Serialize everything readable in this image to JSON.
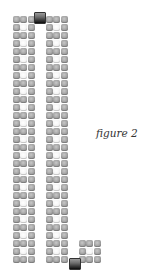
{
  "caption": "figure 2",
  "bead_grid": {
    "row_height_px": 8,
    "bead_width_px": 7.3,
    "white_center_on_even_rows": true,
    "columns": [
      {
        "name": "left-column",
        "x": 13,
        "y": 16,
        "rows": 31,
        "beads_per_row": 3
      },
      {
        "name": "right-column",
        "x": 46,
        "y": 16,
        "rows": 31,
        "beads_per_row": 3
      },
      {
        "name": "foot-column",
        "x": 79,
        "y": 240,
        "rows": 3,
        "beads_per_row": 3,
        "first_row_index": 29
      }
    ],
    "connector_beads": [
      {
        "name": "top-connector-bead",
        "x": 34,
        "y": 12,
        "color": "dark"
      },
      {
        "name": "bottom-connector-bead",
        "x": 69,
        "y": 258,
        "color": "dark"
      }
    ]
  },
  "colors": {
    "background": "#ffffff",
    "bead_gray": "#a9a9a9",
    "bead_white": "#f4f4f4",
    "bead_dark": "#2e2e2e",
    "caption_text": "#333333"
  }
}
